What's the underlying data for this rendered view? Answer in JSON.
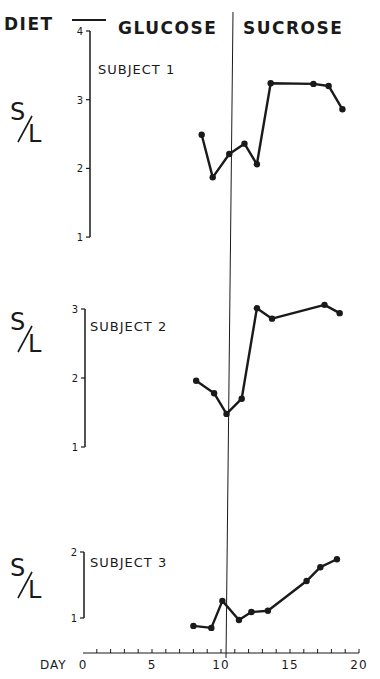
{
  "header": {
    "diet_label": "DIET",
    "phase_1": "GLUCOSE",
    "phase_2": "SUCROSE"
  },
  "y_label": "S/L",
  "x_label": "DAY",
  "x_ticks": [
    "0",
    "5",
    "10",
    "15",
    "20"
  ],
  "colors": {
    "ink": "#1a1a1a",
    "background": "#ffffff"
  },
  "chart_data": [
    {
      "type": "line",
      "title": "SUBJECT 1",
      "xlabel": "DAY",
      "ylabel": "S/L",
      "xlim": [
        0,
        20
      ],
      "ylim": [
        1,
        4
      ],
      "yticks": [
        1,
        2,
        3,
        4
      ],
      "diet_switch_day": 10,
      "diet_phases": [
        {
          "name": "GLUCOSE",
          "days": [
            0,
            10
          ]
        },
        {
          "name": "SUCROSE",
          "days": [
            10,
            20
          ]
        }
      ],
      "x": [
        8.6,
        9.4,
        10.6,
        11.7,
        12.6,
        13.6,
        16.7,
        17.8,
        18.8
      ],
      "values": [
        2.49,
        1.87,
        2.21,
        2.36,
        2.06,
        3.24,
        3.23,
        3.2,
        2.86
      ]
    },
    {
      "type": "line",
      "title": "SUBJECT 2",
      "xlabel": "DAY",
      "ylabel": "S/L",
      "xlim": [
        0,
        20
      ],
      "ylim": [
        1,
        3
      ],
      "yticks": [
        1,
        2,
        3
      ],
      "diet_switch_day": 10,
      "x": [
        8.2,
        9.5,
        10.4,
        11.5,
        12.6,
        13.7,
        17.5,
        18.6
      ],
      "values": [
        1.96,
        1.78,
        1.48,
        1.7,
        3.01,
        2.86,
        3.06,
        2.94
      ]
    },
    {
      "type": "line",
      "title": "SUBJECT 3",
      "xlabel": "DAY",
      "ylabel": "S/L",
      "xlim": [
        0,
        20
      ],
      "ylim": [
        1,
        2
      ],
      "yticks": [
        1,
        2
      ],
      "diet_switch_day": 10,
      "x": [
        8.0,
        9.3,
        10.1,
        11.3,
        12.2,
        13.4,
        16.2,
        17.2,
        18.4
      ],
      "values": [
        0.88,
        0.85,
        1.26,
        0.97,
        1.09,
        1.11,
        1.56,
        1.77,
        1.89
      ]
    }
  ]
}
